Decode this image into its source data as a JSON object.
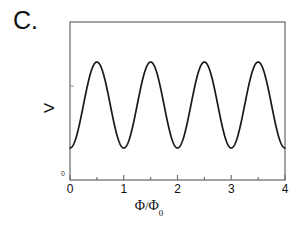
{
  "figure": {
    "panel_label": "C.",
    "background_color": "#ffffff",
    "line_color": "#1a1a1a",
    "axis_color": "#555555"
  },
  "axes": {
    "y_label": "V",
    "y_origin_tick_label": "0",
    "x_title_numerator": "Φ",
    "x_title_slash": "/",
    "x_title_denominator": "Φ",
    "x_title_subscript": "0",
    "x_tick_labels": [
      "0",
      "1",
      "2",
      "3",
      "4"
    ]
  },
  "chart_data": {
    "type": "line",
    "title": "C.",
    "xlabel": "Φ/Φ₀",
    "ylabel": "V",
    "xlim": [
      0,
      4
    ],
    "ylim": [
      0,
      1
    ],
    "grid": false,
    "legend": null,
    "x_major_ticks": [
      0,
      1,
      2,
      3,
      4
    ],
    "x_minor_ticks": [
      0.5,
      1.5,
      2.5,
      3.5
    ],
    "y_ticks": [
      0
    ],
    "series": [
      {
        "name": "V",
        "amplitude": 0.5,
        "offset": 0.5,
        "period": 1.0,
        "phase_shift": 0.5,
        "peak_x": [
          0.5,
          1.5,
          2.5,
          3.5
        ],
        "trough_x": [
          0.0,
          1.0,
          2.0,
          3.0,
          4.0
        ],
        "x": [
          0,
          0.1,
          0.2,
          0.3,
          0.4,
          0.5,
          0.6,
          0.7,
          0.8,
          0.9,
          1.0,
          1.1,
          1.2,
          1.3,
          1.4,
          1.5,
          1.6,
          1.7,
          1.8,
          1.9,
          2.0,
          2.1,
          2.2,
          2.3,
          2.4,
          2.5,
          2.6,
          2.7,
          2.8,
          2.9,
          3.0,
          3.1,
          3.2,
          3.3,
          3.4,
          3.5,
          3.6,
          3.7,
          3.8,
          3.9,
          4.0
        ],
        "values": [
          0.0,
          0.024,
          0.095,
          0.206,
          0.345,
          0.5,
          0.655,
          0.794,
          0.905,
          0.976,
          1.0,
          0.976,
          0.905,
          0.794,
          0.655,
          0.5,
          0.345,
          0.206,
          0.095,
          0.024,
          0.0,
          0.024,
          0.095,
          0.206,
          0.345,
          0.5,
          0.655,
          0.794,
          0.905,
          0.976,
          1.0,
          0.976,
          0.905,
          0.794,
          0.655,
          0.5,
          0.345,
          0.206,
          0.095,
          0.024,
          0.0
        ]
      }
    ]
  },
  "plot_geometry": {
    "frame_left": 70,
    "frame_right": 285,
    "frame_top": 22,
    "frame_bottom": 180,
    "curve_peak_y": 62,
    "curve_trough_y": 148
  }
}
